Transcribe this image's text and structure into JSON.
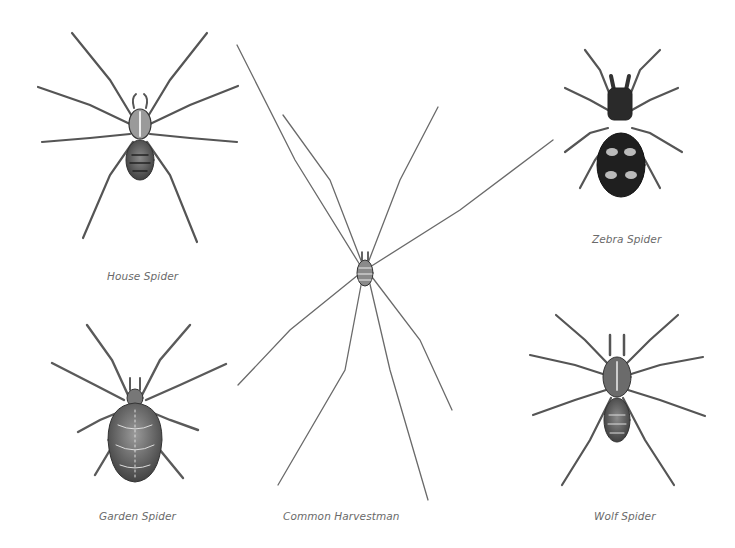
{
  "plate": {
    "background": "#ffffff",
    "specimens": [
      {
        "id": "house",
        "label": "House Spider"
      },
      {
        "id": "zebra",
        "label": "Zebra Spider"
      },
      {
        "id": "harvestman",
        "label": "Common Harvestman"
      },
      {
        "id": "garden",
        "label": "Garden Spider"
      },
      {
        "id": "wolf",
        "label": "Wolf Spider"
      }
    ]
  }
}
